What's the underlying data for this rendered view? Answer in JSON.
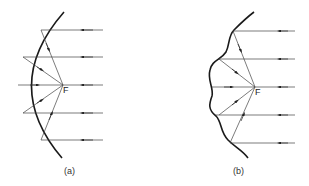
{
  "figure": {
    "panels": [
      {
        "id": "a",
        "label": "(a)",
        "mirror_type": "smooth parabolic reflector",
        "focus_label": "F",
        "incoming_rays": 5,
        "description": "Parallel rays reflect off a smooth concave mirror and converge at focal point F"
      },
      {
        "id": "b",
        "label": "(b)",
        "mirror_type": "irregular (wavy) reflector",
        "focus_label": "F",
        "incoming_rays": 5,
        "description": "Parallel rays reflect off an irregular wavy surface yet still converge at focal point F"
      }
    ],
    "colors": {
      "line": "#333333",
      "mirror": "#1a1a1a",
      "background": "#ffffff"
    }
  }
}
